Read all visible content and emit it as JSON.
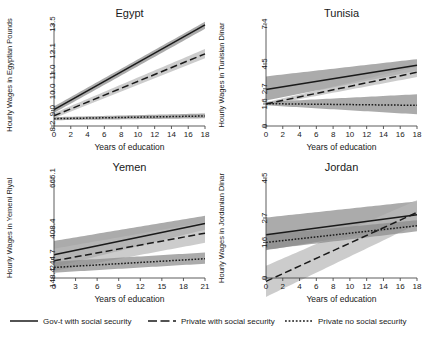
{
  "figure": {
    "title": "",
    "xlabel": "Years of education"
  },
  "legend": {
    "items": [
      {
        "label": "Gov-t with social security",
        "style": "solid",
        "color": "#1a1a1a"
      },
      {
        "label": "Private with social security",
        "style": "dashed",
        "color": "#1a1a1a"
      },
      {
        "label": "Private no social security",
        "style": "dotted",
        "color": "#1a1a1a"
      }
    ]
  },
  "chart_data": [
    {
      "type": "line",
      "title": "Egypt",
      "xlabel": "Years of education",
      "ylabel": "Hourly Wages in Egyptian Pounds",
      "xlim": [
        0,
        18
      ],
      "ylim": [
        8.2,
        13.5
      ],
      "xticks": [
        0,
        2,
        4,
        6,
        8,
        10,
        12,
        14,
        16,
        18
      ],
      "yticks": [
        8.2,
        9.0,
        10.0,
        11.0,
        12.1,
        13.5
      ],
      "ytick_labels": [
        "8.2",
        "9.0",
        "10.0",
        "11.0",
        "12.1",
        "13.5"
      ],
      "grid": false,
      "legend_position": "bottom",
      "series": [
        {
          "name": "Gov-t with social security",
          "style": "solid",
          "x": [
            0,
            18
          ],
          "values": [
            9.05,
            13.45
          ],
          "band_low": [
            8.88,
            13.25
          ],
          "band_high": [
            9.22,
            13.62
          ]
        },
        {
          "name": "Private with social security",
          "style": "dashed",
          "x": [
            0,
            18
          ],
          "values": [
            8.73,
            11.95
          ],
          "band_low": [
            8.6,
            11.72
          ],
          "band_high": [
            8.87,
            12.2
          ]
        },
        {
          "name": "Private no social security",
          "style": "dotted",
          "x": [
            0,
            18
          ],
          "values": [
            8.58,
            8.72
          ],
          "band_low": [
            8.5,
            8.6
          ],
          "band_high": [
            8.66,
            8.85
          ]
        }
      ]
    },
    {
      "type": "line",
      "title": "Tunisia",
      "xlabel": "Years of education",
      "ylabel": "Hourly Wages in Tunisian Dinar",
      "xlim": [
        0,
        18
      ],
      "ylim": [
        0,
        7.4
      ],
      "xticks": [
        0,
        2,
        4,
        6,
        8,
        10,
        12,
        14,
        16,
        18
      ],
      "yticks": [
        0,
        1.6,
        2.7,
        4.5,
        7.4
      ],
      "ytick_labels": [
        "0",
        "1.6",
        "2.7",
        "4.5",
        "7.4"
      ],
      "grid": false,
      "legend_position": "bottom",
      "series": [
        {
          "name": "Gov-t with social security",
          "style": "solid",
          "x": [
            0,
            18
          ],
          "values": [
            2.65,
            4.4
          ],
          "band_low": [
            1.85,
            4.0
          ],
          "band_high": [
            3.6,
            4.85
          ]
        },
        {
          "name": "Private with social security",
          "style": "dashed",
          "x": [
            0,
            18
          ],
          "values": [
            1.6,
            3.9
          ],
          "band_low": [
            1.5,
            3.55
          ],
          "band_high": [
            1.72,
            4.3
          ]
        },
        {
          "name": "Private no social security",
          "style": "dotted",
          "x": [
            0,
            18
          ],
          "values": [
            1.62,
            1.5
          ],
          "band_low": [
            1.5,
            0.85
          ],
          "band_high": [
            1.75,
            2.3
          ]
        }
      ]
    },
    {
      "type": "line",
      "title": "Yemen",
      "xlabel": "Years of education",
      "ylabel": "Hourly Wages in Yemeni Riyal",
      "xlim": [
        0,
        21
      ],
      "ylim": [
        148.4,
        665.1
      ],
      "xticks": [
        0,
        3,
        6,
        9,
        12,
        15,
        18,
        21
      ],
      "yticks": [
        148.4,
        244.7,
        403.4,
        665.1
      ],
      "ytick_labels": [
        "148.4",
        "244.7",
        "403.4",
        "665.1"
      ],
      "grid": false,
      "legend_position": "bottom",
      "series": [
        {
          "name": "Gov-t with social security",
          "style": "solid",
          "x": [
            0,
            21
          ],
          "values": [
            268,
            430
          ],
          "band_low": [
            205,
            398
          ],
          "band_high": [
            340,
            470
          ]
        },
        {
          "name": "Private with social security",
          "style": "dashed",
          "x": [
            0,
            21
          ],
          "values": [
            237,
            380
          ],
          "band_low": [
            185,
            330
          ],
          "band_high": [
            300,
            437
          ]
        },
        {
          "name": "Private no social security",
          "style": "dotted",
          "x": [
            0,
            21
          ],
          "values": [
            203,
            248
          ],
          "band_low": [
            176,
            222
          ],
          "band_high": [
            233,
            280
          ]
        }
      ]
    },
    {
      "type": "line",
      "title": "Jordan",
      "xlabel": "Years of education",
      "ylabel": "Hourly Wages in Jordanian Dinar",
      "xlim": [
        0,
        18
      ],
      "ylim": [
        0,
        4.5
      ],
      "xticks": [
        0,
        2,
        4,
        6,
        8,
        10,
        12,
        14,
        16,
        18
      ],
      "yticks": [
        0,
        1.6,
        2.7,
        4.5
      ],
      "ytick_labels": [
        "0",
        "1.6",
        "2.7",
        "4.5"
      ],
      "grid": false,
      "legend_position": "bottom",
      "series": [
        {
          "name": "Gov-t with social security",
          "style": "solid",
          "x": [
            0,
            18
          ],
          "values": [
            1.95,
            2.85
          ],
          "band_low": [
            1.25,
            2.35
          ],
          "band_high": [
            2.72,
            3.45
          ]
        },
        {
          "name": "Private with social security",
          "style": "dashed",
          "x": [
            0,
            18
          ],
          "values": [
            -0.15,
            2.95
          ],
          "band_low": [
            -0.85,
            2.42
          ],
          "band_high": [
            0.55,
            3.5
          ]
        },
        {
          "name": "Private no social security",
          "style": "dotted",
          "x": [
            0,
            18
          ],
          "values": [
            1.6,
            2.35
          ],
          "band_low": [
            1.28,
            2.1
          ],
          "band_high": [
            1.95,
            2.6
          ]
        }
      ]
    }
  ],
  "colors": {
    "line": "#1a1a1a",
    "band_dark": "#8a8a8a",
    "band_light": "#b8b8b8",
    "axis": "#4a4a4a",
    "background": "#ffffff"
  }
}
